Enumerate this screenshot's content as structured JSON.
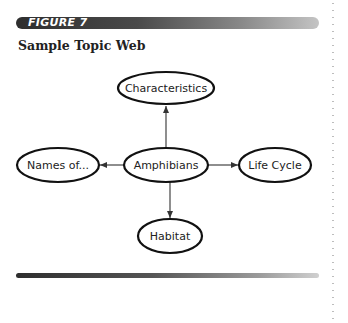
{
  "figure": {
    "label": "FIGURE 7",
    "title": "Sample Topic Web"
  },
  "diagram": {
    "center": {
      "label": "Amphibians"
    },
    "nodes": {
      "top": {
        "label": "Characteristics"
      },
      "left": {
        "label": "Names of..."
      },
      "right": {
        "label": "Life Cycle"
      },
      "bottom": {
        "label": "Habitat"
      }
    },
    "edges": [
      {
        "from": "Amphibians",
        "to": "Characteristics"
      },
      {
        "from": "Amphibians",
        "to": "Names of..."
      },
      {
        "from": "Amphibians",
        "to": "Life Cycle"
      },
      {
        "from": "Amphibians",
        "to": "Habitat"
      }
    ]
  },
  "colors": {
    "ink": "#222222",
    "bar_dark": "#2e2e2e",
    "bar_light": "#c4c4c4"
  }
}
